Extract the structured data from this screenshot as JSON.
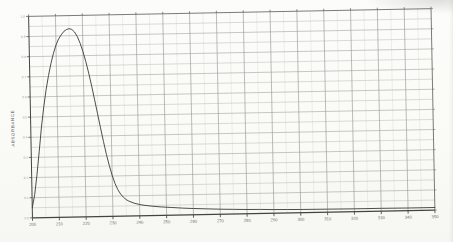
{
  "chart_data": {
    "type": "line",
    "title": "",
    "xlabel": "",
    "ylabel": "ABSORBANCE",
    "xlim": [
      200,
      350
    ],
    "ylim": [
      0,
      1.0
    ],
    "x_ticks": [
      200,
      210,
      220,
      230,
      240,
      250,
      260,
      270,
      280,
      290,
      300,
      310,
      320,
      330,
      340,
      350
    ],
    "y_ticks": [
      0.0,
      0.1,
      0.2,
      0.3,
      0.4,
      0.5,
      0.6,
      0.7,
      0.8,
      0.9,
      1.0
    ],
    "grid": "on",
    "legend": "none",
    "series": [
      {
        "name": "absorbance-spectrum",
        "peak_wavelength_nm": 215,
        "peak_absorbance": 0.935,
        "points": [
          [
            200,
            0.05
          ],
          [
            201,
            0.115
          ],
          [
            202,
            0.215
          ],
          [
            203,
            0.33
          ],
          [
            204,
            0.45
          ],
          [
            205,
            0.55
          ],
          [
            206,
            0.635
          ],
          [
            207,
            0.705
          ],
          [
            208,
            0.765
          ],
          [
            209,
            0.815
          ],
          [
            210,
            0.855
          ],
          [
            211,
            0.885
          ],
          [
            212,
            0.905
          ],
          [
            213,
            0.922
          ],
          [
            214,
            0.931
          ],
          [
            215,
            0.935
          ],
          [
            216,
            0.931
          ],
          [
            217,
            0.918
          ],
          [
            218,
            0.895
          ],
          [
            219,
            0.862
          ],
          [
            220,
            0.82
          ],
          [
            221,
            0.77
          ],
          [
            222,
            0.712
          ],
          [
            223,
            0.648
          ],
          [
            224,
            0.58
          ],
          [
            225,
            0.51
          ],
          [
            226,
            0.44
          ],
          [
            227,
            0.372
          ],
          [
            228,
            0.308
          ],
          [
            229,
            0.252
          ],
          [
            230,
            0.203
          ],
          [
            231,
            0.163
          ],
          [
            232,
            0.132
          ],
          [
            233,
            0.11
          ],
          [
            234,
            0.094
          ],
          [
            235,
            0.082
          ],
          [
            236,
            0.074
          ],
          [
            238,
            0.063
          ],
          [
            240,
            0.056
          ],
          [
            242,
            0.051
          ],
          [
            245,
            0.046
          ],
          [
            248,
            0.042
          ],
          [
            252,
            0.038
          ],
          [
            256,
            0.034
          ],
          [
            260,
            0.031
          ],
          [
            265,
            0.028
          ],
          [
            270,
            0.025
          ],
          [
            275,
            0.023
          ],
          [
            280,
            0.021
          ],
          [
            285,
            0.02
          ],
          [
            290,
            0.018
          ],
          [
            295,
            0.017
          ],
          [
            300,
            0.016
          ],
          [
            310,
            0.015
          ],
          [
            320,
            0.014
          ],
          [
            330,
            0.014
          ],
          [
            340,
            0.013
          ],
          [
            350,
            0.013
          ]
        ]
      }
    ],
    "colors": {
      "paper": "#fafaf7",
      "frame": "#5c5c56",
      "axis": "#44443f",
      "grid_major_v": "#8f938e",
      "grid_major_h": "#9b9e98",
      "grid_minor_h": "#b7bab3",
      "grid_minor_v": "#d6d8d3",
      "tick": "#3c3c38",
      "tick_label": "#6f6f68",
      "ylabel_color": "#55544e",
      "curve": "#3b3b37"
    }
  }
}
